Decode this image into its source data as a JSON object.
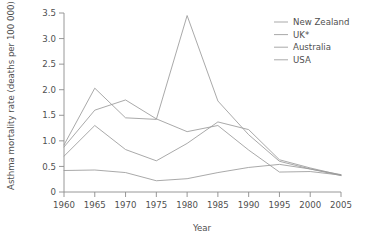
{
  "chart_data": {
    "type": "line",
    "title": "",
    "xlabel": "Year",
    "ylabel": "Asthma mortality rate (deaths per 100 000)",
    "x": [
      1960,
      1965,
      1970,
      1975,
      1980,
      1985,
      1990,
      1995,
      2000,
      2005
    ],
    "xlim": [
      1960,
      2005
    ],
    "ylim": [
      0,
      3.5
    ],
    "xticks": [
      "1960",
      "1965",
      "1970",
      "1975",
      "1980",
      "1985",
      "1990",
      "1995",
      "2000",
      "2005"
    ],
    "yticks": [
      "0",
      "0.5",
      "1.0",
      "1.5",
      "2.0",
      "2.5",
      "3.0",
      "3.5"
    ],
    "grid": false,
    "legend_position": "top-right",
    "series": [
      {
        "name": "New Zealand",
        "color": "#9a9a9a",
        "values": [
          0.92,
          2.03,
          1.45,
          1.42,
          3.45,
          1.78,
          1.12,
          0.6,
          0.45,
          0.34
        ]
      },
      {
        "name": "UK*",
        "color": "#9a9a9a",
        "values": [
          0.88,
          1.6,
          1.8,
          1.43,
          1.18,
          1.3,
          0.82,
          0.39,
          0.4,
          0.33
        ]
      },
      {
        "name": "Australia",
        "color": "#9a9a9a",
        "values": [
          0.7,
          1.3,
          0.83,
          0.61,
          0.95,
          1.37,
          1.22,
          0.63,
          0.47,
          0.33
        ]
      },
      {
        "name": "USA",
        "color": "#9a9a9a",
        "values": [
          0.42,
          0.43,
          0.38,
          0.22,
          0.26,
          0.38,
          0.48,
          0.54,
          0.45,
          0.32
        ]
      }
    ]
  },
  "legend": {
    "items": [
      {
        "label": "New Zealand"
      },
      {
        "label": "UK*"
      },
      {
        "label": "Australia"
      },
      {
        "label": "USA"
      }
    ]
  }
}
